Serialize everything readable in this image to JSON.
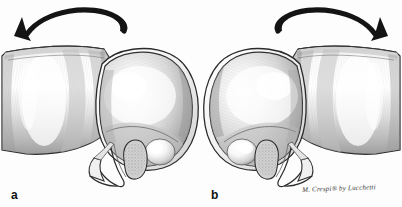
{
  "figure": {
    "type": "medical-illustration",
    "style": "grayscale pen-and-ink anatomical drawing",
    "background_color": "#fdfdfd",
    "panel_count": 2
  },
  "panels": [
    {
      "label": "a",
      "direction": "counterclockwise",
      "arrow": {
        "name": "rotation-arrow-left",
        "points_to": "left",
        "color": "#141414"
      },
      "structures": [
        "long bone shaft",
        "rounded articular head",
        "articular cartilage rim",
        "stippled fibrocartilage disc",
        "ligament band"
      ]
    },
    {
      "label": "b",
      "direction": "clockwise",
      "arrow": {
        "name": "rotation-arrow-right",
        "points_to": "right",
        "color": "#141414"
      },
      "structures": [
        "rounded articular head",
        "articular cartilage rim",
        "stippled fibrocartilage disc",
        "ligament band",
        "long bone shaft"
      ]
    }
  ],
  "signature": {
    "text": "M. Crespi® by Lucchetti",
    "color": "#3b3b3b"
  },
  "colors": {
    "ink": "#141414",
    "outline": "#2a2a2a",
    "bone_light": "#f4f4f4",
    "bone_mid": "#c9c9c9",
    "bone_dark": "#8f8f8f",
    "shadow": "#6e6e6e",
    "stipple": "#9a9a9a",
    "background": "#fdfdfd"
  }
}
